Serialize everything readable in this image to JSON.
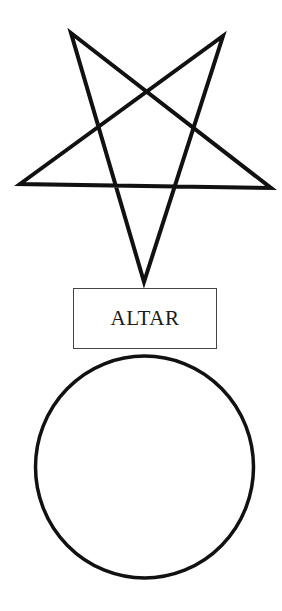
{
  "diagram": {
    "pentagram": {
      "shape": "inverted-pentagram",
      "points": [
        [
          71,
          33
        ],
        [
          223,
          36
        ],
        [
          20,
          184
        ],
        [
          271,
          188
        ],
        [
          144,
          282
        ]
      ],
      "stroke": "#111111",
      "stroke_width": 4
    },
    "altar": {
      "label": "ALTAR",
      "border_color": "#444444"
    },
    "circle": {
      "cx": 144.5,
      "cy": 467,
      "rx": 109,
      "ry": 111,
      "stroke": "#111111",
      "stroke_width": 3.5
    }
  }
}
